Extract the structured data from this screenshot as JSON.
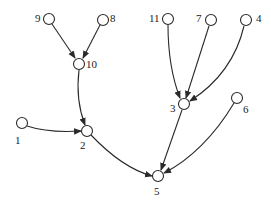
{
  "diagram": {
    "type": "directed-tree",
    "nodes": [
      {
        "id": "9",
        "x": 49,
        "y": 19,
        "label": "9",
        "lx": 35,
        "ly": 22
      },
      {
        "id": "8",
        "x": 103,
        "y": 20,
        "label": "8",
        "lx": 110,
        "ly": 22
      },
      {
        "id": "10",
        "x": 79,
        "y": 64,
        "label": "10",
        "lx": 86,
        "ly": 68
      },
      {
        "id": "11",
        "x": 168,
        "y": 19,
        "label": "11",
        "lx": 149,
        "ly": 22
      },
      {
        "id": "7",
        "x": 211,
        "y": 20,
        "label": "7",
        "lx": 196,
        "ly": 22
      },
      {
        "id": "4",
        "x": 246,
        "y": 20,
        "label": "4",
        "lx": 256,
        "ly": 22
      },
      {
        "id": "3",
        "x": 184,
        "y": 104,
        "label": "3",
        "lx": 170,
        "ly": 112
      },
      {
        "id": "6",
        "x": 237,
        "y": 98,
        "label": "6",
        "lx": 243,
        "ly": 113
      },
      {
        "id": "1",
        "x": 22,
        "y": 123,
        "label": "1",
        "lx": 15,
        "ly": 144
      },
      {
        "id": "2",
        "x": 87,
        "y": 131,
        "label": "2",
        "lx": 80,
        "ly": 149
      },
      {
        "id": "5",
        "x": 158,
        "y": 176,
        "label": "5",
        "lx": 154,
        "ly": 195
      }
    ],
    "edges": [
      {
        "from": "9",
        "to": "10",
        "path": "M52,24 L75,58"
      },
      {
        "from": "8",
        "to": "10",
        "path": "M100,25 L83,58"
      },
      {
        "from": "10",
        "to": "2",
        "path": "M79,70 C76,95 80,112 85,125"
      },
      {
        "from": "1",
        "to": "2",
        "path": "M27,126 C45,132 65,132 81,131"
      },
      {
        "from": "11",
        "to": "3",
        "path": "M168,25 C168,55 173,80 180,98"
      },
      {
        "from": "7",
        "to": "3",
        "path": "M209,26 L186,98"
      },
      {
        "from": "4",
        "to": "3",
        "path": "M244,26 C236,60 215,85 190,101"
      },
      {
        "from": "2",
        "to": "5",
        "path": "M91,135 C110,155 130,170 152,176"
      },
      {
        "from": "3",
        "to": "5",
        "path": "M182,110 L161,170"
      },
      {
        "from": "6",
        "to": "5",
        "path": "M234,103 C215,135 190,160 164,173"
      }
    ]
  }
}
